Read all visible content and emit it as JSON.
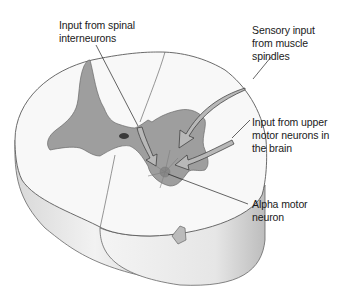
{
  "figure": {
    "colors": {
      "white_matter": "#f7f7f7",
      "gray_matter": "#9a9a9a",
      "outline": "#555555",
      "shadow": "#cfcfcf",
      "arrow_fill": "#b5b5b5",
      "text": "#1a1a1a"
    }
  },
  "labels": [
    {
      "id": "spinal-interneurons",
      "text": "Input from spinal\ninterneurons"
    },
    {
      "id": "muscle-spindles",
      "text": "Sensory input\nfrom muscle\nspindles"
    },
    {
      "id": "upper-motor-neurons",
      "text": "Input from upper\nmotor neurons in\nthe brain"
    },
    {
      "id": "alpha-motor-neuron",
      "text": "Alpha motor\nneuron"
    }
  ]
}
